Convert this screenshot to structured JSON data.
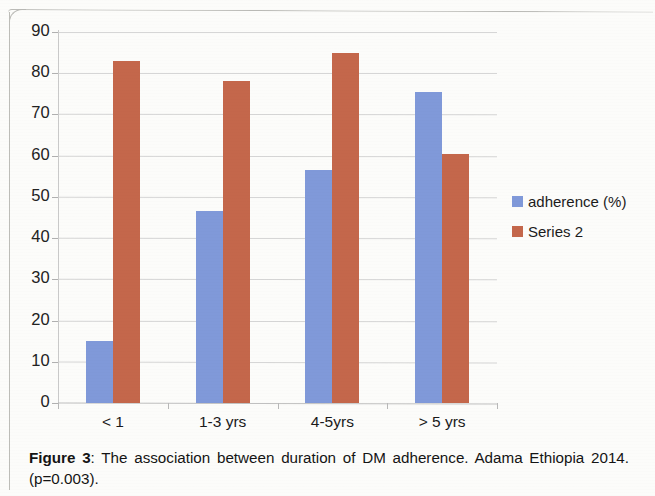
{
  "chart_data": {
    "type": "bar",
    "title": "",
    "xlabel": "",
    "ylabel": "",
    "categories": [
      "< 1",
      "1-3 yrs",
      "4-5yrs",
      "> 5 yrs"
    ],
    "series": [
      {
        "name": "adherence (%)",
        "color": "#8099d9",
        "values": [
          15,
          46.5,
          56.5,
          75.5
        ]
      },
      {
        "name": "Series 2",
        "color": "#c4674b",
        "values": [
          83,
          78,
          85,
          60.5
        ]
      }
    ],
    "ylim": [
      0,
      90
    ],
    "ytick_step": 10,
    "ytick_labels": [
      "0",
      "10",
      "20",
      "30",
      "40",
      "50",
      "60",
      "70",
      "80",
      "90"
    ],
    "grid": "horizontal",
    "legend_position": "right"
  },
  "legend": {
    "items": [
      {
        "label": "adherence (%)",
        "color": "#8099d9"
      },
      {
        "label": "Series 2",
        "color": "#c4674b"
      }
    ]
  },
  "caption": {
    "figure_label": "Figure 3",
    "separator": ": ",
    "text": "The association between duration of DM adherence. Adama Ethiopia 2014. (p=0.003)."
  }
}
